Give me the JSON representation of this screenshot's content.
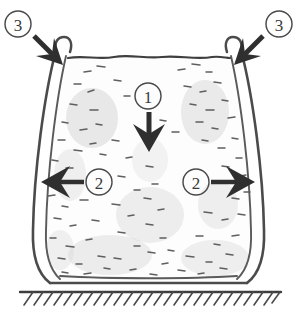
{
  "figure": {
    "title": "Hand-drawn cross-section of a flexible-walled vessel filled with granular material, showing applied load and reaction directions",
    "background_color": "#ffffff",
    "ink_color": "#3f3f3f",
    "arrow_color": "#2f2f2f"
  },
  "callouts": [
    {
      "id": "callout-1",
      "label": "1",
      "meaning": "downward applied load at top centre of fill",
      "circle": {
        "cx": 148,
        "cy": 96,
        "r": 13
      },
      "arrow": {
        "direction": "down",
        "from_x": 149,
        "from_y": 110,
        "to_x": 149,
        "to_y": 150
      }
    },
    {
      "id": "callout-2-left",
      "label": "2",
      "meaning": "lateral outward pressure against the left wall",
      "circle": {
        "cx": 99,
        "cy": 182,
        "r": 13
      },
      "arrow": {
        "direction": "left",
        "from_x": 84,
        "from_y": 182,
        "to_x": 42,
        "to_y": 182
      }
    },
    {
      "id": "callout-2-right",
      "label": "2",
      "meaning": "lateral outward pressure against the right wall",
      "circle": {
        "cx": 196,
        "cy": 182,
        "r": 13
      },
      "arrow": {
        "direction": "right",
        "from_x": 211,
        "from_y": 182,
        "to_x": 254,
        "to_y": 182
      }
    },
    {
      "id": "callout-3-left",
      "label": "3",
      "meaning": "top-left rim bead / edge restraint of the flexible wall",
      "circle": {
        "cx": 18,
        "cy": 24,
        "r": 13
      },
      "arrow": {
        "direction": "down-right",
        "from_x": 34,
        "from_y": 36,
        "to_x": 61,
        "to_y": 63
      }
    },
    {
      "id": "callout-3-right",
      "label": "3",
      "meaning": "top-right rim bead / edge restraint of the flexible wall",
      "circle": {
        "cx": 279,
        "cy": 24,
        "r": 13
      },
      "arrow": {
        "direction": "down-left",
        "from_x": 263,
        "from_y": 36,
        "to_x": 236,
        "to_y": 63
      }
    }
  ],
  "vessel": {
    "name": "flexible-walled container",
    "wall_style": "double-line membrane, bulging outward",
    "rim_beads": 2,
    "fill": {
      "name": "granular fill",
      "texture": "scattered short dashes with light grey smudges",
      "color": "#fdfdfd"
    },
    "top_surface": {
      "style": "slightly wavy horizontal line",
      "y": 58
    }
  },
  "ground": {
    "name": "fixed ground support",
    "line_y": 292,
    "hatch_style": "diagonal hatching below line",
    "hatch_count": 26
  }
}
